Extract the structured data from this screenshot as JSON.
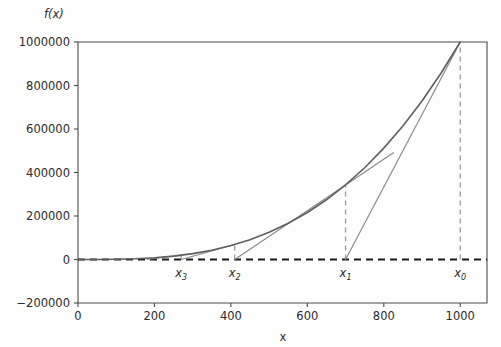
{
  "chart_data": {
    "type": "line",
    "title": "",
    "xlabel": "x",
    "ylabel": "f(x)",
    "xlim": [
      0,
      1070
    ],
    "ylim": [
      -200000,
      1000000
    ],
    "grid": false,
    "legend": null,
    "xticks": [
      "0",
      "200",
      "400",
      "600",
      "800",
      "1000"
    ],
    "xtick_values": [
      0,
      200,
      400,
      600,
      800,
      1000
    ],
    "yticks": [
      "1000000",
      "800000",
      "600000",
      "400000",
      "200000",
      "0",
      "−200000"
    ],
    "ytick_values": [
      1000000,
      800000,
      600000,
      400000,
      200000,
      0,
      -200000
    ],
    "series": [
      {
        "name": "f(x)",
        "kind": "curve",
        "color": "#5f5f5f",
        "x": [
          0,
          50,
          100,
          150,
          200,
          250,
          300,
          350,
          400,
          450,
          500,
          550,
          600,
          650,
          700,
          750,
          800,
          850,
          900,
          950,
          1000
        ],
        "values": [
          0,
          125,
          1000,
          3375,
          8000,
          15625,
          27000,
          42875,
          64000,
          91125,
          125000,
          166375,
          216000,
          274625,
          343000,
          421875,
          512000,
          614125,
          729000,
          857375,
          1000000
        ]
      }
    ],
    "zero_line": {
      "name": "zero-axis",
      "y": 0,
      "style": "dashed",
      "color": "#1a1a1a"
    },
    "iterates": [
      {
        "label": "x₀",
        "sub": "0",
        "x": 1000,
        "fx": 1000000,
        "next_x": 700
      },
      {
        "label": "x₁",
        "sub": "1",
        "x": 700,
        "fx": 343000,
        "next_x": 410
      },
      {
        "label": "x₂",
        "sub": "2",
        "x": 410,
        "fx": 68921,
        "next_x": 270
      },
      {
        "label": "x₃",
        "sub": "3",
        "x": 270,
        "fx": 19683,
        "next_x": 180
      }
    ],
    "tangent_color": "#8a8a8a",
    "dashed_color": "#9a9a9a",
    "frame_color": "#4a4a4a",
    "annotations": []
  }
}
